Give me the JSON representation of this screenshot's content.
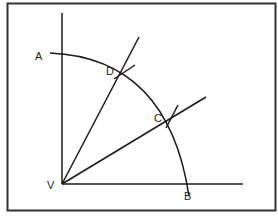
{
  "diagram": {
    "labels": {
      "A": "A",
      "B": "B",
      "C": "C",
      "D": "D",
      "V": "V"
    },
    "colors": {
      "line": "#1a1a1a",
      "frame": "#333333",
      "background": "#ffffff"
    },
    "points": {
      "V": [
        62,
        184
      ],
      "A": [
        52,
        53
      ],
      "B": [
        189,
        184
      ],
      "C": [
        172,
        118
      ],
      "D": [
        126,
        70
      ]
    }
  }
}
